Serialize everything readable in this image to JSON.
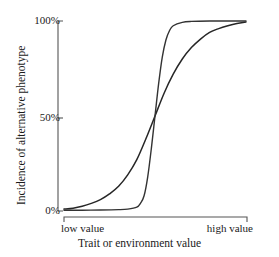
{
  "chart_data": {
    "type": "line",
    "title": "",
    "xlabel": "Trait or environment value",
    "ylabel": "Incidence of alternative phenotype",
    "xlim": [
      0,
      1
    ],
    "ylim": [
      0,
      100
    ],
    "grid": false,
    "legend": "none",
    "x_tick_labels": [
      "low value",
      "high value"
    ],
    "y_tick_labels": [
      "0%",
      "50%",
      "100%"
    ],
    "y_ticks": [
      0,
      50,
      100
    ],
    "annotations": [],
    "series": [
      {
        "name": "gradual response curve",
        "description": "shallow sigmoid rising gradually across the full range of trait values",
        "color": "#262626",
        "x": [
          0.0,
          0.05,
          0.1,
          0.15,
          0.2,
          0.25,
          0.3,
          0.35,
          0.4,
          0.45,
          0.5,
          0.55,
          0.6,
          0.65,
          0.7,
          0.75,
          0.8,
          0.85,
          0.9,
          0.95,
          1.0
        ],
        "values": [
          1,
          1.5,
          2.5,
          4,
          6,
          9,
          13,
          19,
          27,
          38,
          50,
          62,
          72,
          80,
          86,
          90.5,
          94,
          96,
          97.5,
          98.7,
          99.5
        ]
      },
      {
        "name": "threshold response curve",
        "description": "steep near-vertical sigmoid, flat near 0% then switching abruptly to 100%",
        "color": "#333333",
        "x": [
          0.0,
          0.1,
          0.2,
          0.3,
          0.35,
          0.4,
          0.42,
          0.44,
          0.46,
          0.48,
          0.5,
          0.52,
          0.54,
          0.56,
          0.58,
          0.6,
          0.65,
          0.7,
          0.8,
          0.9,
          1.0
        ],
        "values": [
          0.4,
          0.4,
          0.5,
          0.7,
          1,
          2,
          4,
          8,
          18,
          33,
          50,
          67,
          81,
          90,
          95,
          97.5,
          99.3,
          99.8,
          100,
          100,
          100
        ]
      }
    ]
  },
  "axes": {
    "y_tick_100": "100%",
    "y_tick_50": "50%",
    "y_tick_0": "0%",
    "x_tick_low": "low value",
    "x_tick_high": "high value",
    "x_axis_title": "Trait or environment value",
    "y_axis_title": "Incidence of alternative phenotype"
  },
  "style": {
    "axis_color": "#555555",
    "text_color": "#1a1a1a",
    "background": "#ffffff",
    "curve_gradual_color": "#262626",
    "curve_threshold_color": "#333333"
  }
}
